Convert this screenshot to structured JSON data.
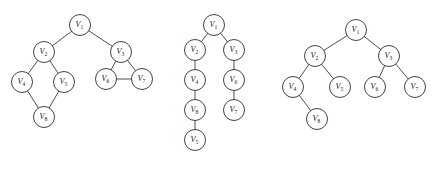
{
  "figure": {
    "title": "",
    "background_color": "#ffffff",
    "node_stroke_color": "#2f2f2f",
    "edge_stroke_color": "#3a3a3a",
    "node_fill_color": "#ffffff",
    "label_color": "#1a1a1a",
    "node_radius": 10.5
  },
  "chart_data": {
    "type": "diagram",
    "subtype": "node-link-graph",
    "title": "",
    "xlabel": "",
    "ylabel": "",
    "grid": false,
    "legend": null,
    "panel_count": 3,
    "panels": [
      {
        "id": "panel-1",
        "caption": "",
        "description": "Undirected graph with a diamond cycle on the left branch and a triangle on the right branch",
        "nodes": [
          {
            "id": "V1",
            "label": "V",
            "subscript": "1",
            "x": 80,
            "y": 25
          },
          {
            "id": "V2",
            "label": "V",
            "subscript": "2",
            "x": 44,
            "y": 52
          },
          {
            "id": "V3",
            "label": "V",
            "subscript": "3",
            "x": 121,
            "y": 52
          },
          {
            "id": "V4",
            "label": "V",
            "subscript": "4",
            "x": 22,
            "y": 82
          },
          {
            "id": "V5",
            "label": "V",
            "subscript": "5",
            "x": 64,
            "y": 82
          },
          {
            "id": "V6",
            "label": "V",
            "subscript": "6",
            "x": 106,
            "y": 79
          },
          {
            "id": "V7",
            "label": "V",
            "subscript": "7",
            "x": 142,
            "y": 79
          },
          {
            "id": "V8",
            "label": "V",
            "subscript": "8",
            "x": 44,
            "y": 117
          }
        ],
        "edges": [
          {
            "from": "V1",
            "to": "V2"
          },
          {
            "from": "V1",
            "to": "V3"
          },
          {
            "from": "V2",
            "to": "V4"
          },
          {
            "from": "V2",
            "to": "V5"
          },
          {
            "from": "V4",
            "to": "V8"
          },
          {
            "from": "V5",
            "to": "V8"
          },
          {
            "from": "V3",
            "to": "V6"
          },
          {
            "from": "V3",
            "to": "V7"
          },
          {
            "from": "V6",
            "to": "V7"
          }
        ]
      },
      {
        "id": "panel-2",
        "caption": "",
        "description": "Depth-first search tree: two vertical chains descending from the root",
        "nodes": [
          {
            "id": "V1",
            "label": "V",
            "subscript": "1",
            "x": 214,
            "y": 25
          },
          {
            "id": "V2",
            "label": "V",
            "subscript": "2",
            "x": 195,
            "y": 50
          },
          {
            "id": "V3",
            "label": "V",
            "subscript": "3",
            "x": 234,
            "y": 50
          },
          {
            "id": "V4",
            "label": "V",
            "subscript": "4",
            "x": 195,
            "y": 80
          },
          {
            "id": "V6",
            "label": "V",
            "subscript": "6",
            "x": 234,
            "y": 80
          },
          {
            "id": "V8",
            "label": "V",
            "subscript": "8",
            "x": 195,
            "y": 110
          },
          {
            "id": "V7",
            "label": "V",
            "subscript": "7",
            "x": 234,
            "y": 110
          },
          {
            "id": "V5",
            "label": "V",
            "subscript": "5",
            "x": 195,
            "y": 140
          }
        ],
        "edges": [
          {
            "from": "V1",
            "to": "V2"
          },
          {
            "from": "V1",
            "to": "V3"
          },
          {
            "from": "V2",
            "to": "V4"
          },
          {
            "from": "V4",
            "to": "V8"
          },
          {
            "from": "V8",
            "to": "V5"
          },
          {
            "from": "V3",
            "to": "V6"
          },
          {
            "from": "V6",
            "to": "V7"
          }
        ]
      },
      {
        "id": "panel-3",
        "caption": "",
        "description": "Breadth-first search tree: root with two children, four grandchildren and one great-grandchild",
        "nodes": [
          {
            "id": "V1",
            "label": "V",
            "subscript": "1",
            "x": 356,
            "y": 30
          },
          {
            "id": "V2",
            "label": "V",
            "subscript": "2",
            "x": 315,
            "y": 56
          },
          {
            "id": "V3",
            "label": "V",
            "subscript": "3",
            "x": 389,
            "y": 56
          },
          {
            "id": "V4",
            "label": "V",
            "subscript": "4",
            "x": 293,
            "y": 87
          },
          {
            "id": "V5",
            "label": "V",
            "subscript": "5",
            "x": 340,
            "y": 87
          },
          {
            "id": "V6",
            "label": "V",
            "subscript": "6",
            "x": 375,
            "y": 87
          },
          {
            "id": "V7",
            "label": "V",
            "subscript": "7",
            "x": 415,
            "y": 87
          },
          {
            "id": "V8",
            "label": "V",
            "subscript": "8",
            "x": 317,
            "y": 119
          }
        ],
        "edges": [
          {
            "from": "V1",
            "to": "V2"
          },
          {
            "from": "V1",
            "to": "V3"
          },
          {
            "from": "V2",
            "to": "V4"
          },
          {
            "from": "V2",
            "to": "V5"
          },
          {
            "from": "V3",
            "to": "V6"
          },
          {
            "from": "V3",
            "to": "V7"
          },
          {
            "from": "V4",
            "to": "V8"
          }
        ]
      }
    ]
  }
}
